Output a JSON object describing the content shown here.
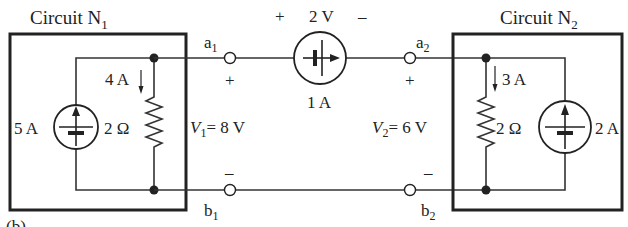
{
  "figure_label": "(b)",
  "circuit_n1": {
    "title": "Circuit N",
    "title_sub": "1",
    "source": {
      "value": "5 A",
      "icon": "current-source-up"
    },
    "resistor": {
      "value": "2 Ω"
    },
    "resistor_current": "4 A"
  },
  "circuit_n2": {
    "title": "Circuit N",
    "title_sub": "2",
    "source": {
      "value": "2 A",
      "icon": "current-source-up"
    },
    "resistor": {
      "value": "2 Ω"
    },
    "resistor_current": "3 A"
  },
  "middle_source": {
    "voltage_label": "2 V",
    "plus": "+",
    "minus": "–",
    "current_label": "1 A",
    "icon": "current-source-right"
  },
  "terminals": {
    "a1": {
      "name": "a",
      "sub": "1"
    },
    "b1": {
      "name": "b",
      "sub": "1"
    },
    "a2": {
      "name": "a",
      "sub": "2"
    },
    "b2": {
      "name": "b",
      "sub": "2"
    }
  },
  "voltages": {
    "v1": {
      "sym": "V",
      "sub": "1",
      "value": "= 8 V",
      "plus": "+",
      "minus": "–"
    },
    "v2": {
      "sym": "V",
      "sub": "2",
      "value": "= 6 V",
      "plus": "+",
      "minus": "–"
    }
  }
}
